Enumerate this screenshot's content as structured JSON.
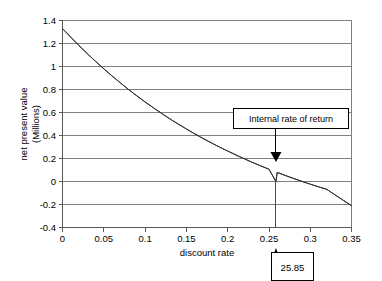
{
  "chart_data": {
    "type": "line",
    "title": "",
    "xlabel": "discount rate",
    "ylabel_line1": "net present value",
    "ylabel_line2": "(Millions)",
    "xlim": [
      0,
      0.35
    ],
    "ylim": [
      -0.4,
      1.4
    ],
    "grid": true,
    "legend": "none",
    "xticks": [
      "0",
      "0.05",
      "0.1",
      "0.15",
      "0.2",
      "0.25",
      "0.3",
      "0.35"
    ],
    "xtick_values": [
      0,
      0.05,
      0.1,
      0.15,
      0.2,
      0.25,
      0.3,
      0.35
    ],
    "yticks": [
      "1.4",
      "1.2",
      "1",
      "0.8",
      "0.6",
      "0.4",
      "0.2",
      "0",
      "-0.2",
      "-0.4"
    ],
    "ytick_values": [
      1.4,
      1.2,
      1,
      0.8,
      0.6,
      0.4,
      0.2,
      0,
      -0.2,
      -0.4
    ],
    "series": [
      {
        "name": "net present value",
        "x": [
          0,
          0.01,
          0.02,
          0.03,
          0.04,
          0.05,
          0.06,
          0.07,
          0.08,
          0.09,
          0.1,
          0.11,
          0.12,
          0.13,
          0.14,
          0.15,
          0.16,
          0.17,
          0.18,
          0.19,
          0.2,
          0.21,
          0.22,
          0.23,
          0.24,
          0.25,
          0.2585,
          0.26,
          0.27,
          0.28,
          0.29,
          0.3,
          0.31,
          0.32,
          0.33,
          0.34,
          0.35
        ],
        "values": [
          1.33,
          1.255,
          1.182,
          1.112,
          1.045,
          0.98,
          0.918,
          0.858,
          0.8,
          0.745,
          0.692,
          0.641,
          0.592,
          0.545,
          0.5,
          0.457,
          0.415,
          0.375,
          0.337,
          0.3,
          0.265,
          0.231,
          0.198,
          0.166,
          0.136,
          0.107,
          0.0,
          0.079,
          0.052,
          0.026,
          0.001,
          -0.023,
          -0.046,
          -0.068,
          -0.116,
          -0.163,
          -0.21
        ]
      }
    ],
    "annotations": [
      {
        "name": "internal-rate-of-return",
        "label": "Internal rate of return",
        "points_to_x": 0.2585,
        "points_to_y": 0.21
      },
      {
        "name": "irr-value-callout",
        "label": "25.85",
        "points_to_x": 0.2585,
        "points_to_y": -0.4
      }
    ],
    "marker_line_x": 0.2585
  }
}
